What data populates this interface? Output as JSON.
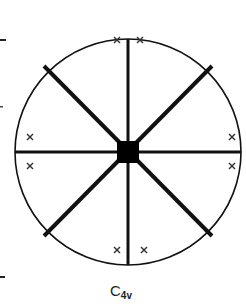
{
  "diagram": {
    "title_main": "C",
    "title_sub": "4v",
    "point_group": "C4v",
    "center": {
      "x": 128,
      "y": 152
    },
    "radius": 113,
    "colors": {
      "stroke": "#111111",
      "background": "#ffffff",
      "marks": "#333333"
    },
    "mirror_lines": [
      {
        "name": "vertical",
        "angle": 90
      },
      {
        "name": "horizontal",
        "angle": 0
      },
      {
        "name": "diagonal-1",
        "angle": 45
      },
      {
        "name": "diagonal-2",
        "angle": 135
      }
    ],
    "rotation_axis_symbol": "filled-square",
    "general_positions": [
      {
        "x": 117,
        "y": 40,
        "symbol": "×"
      },
      {
        "x": 140,
        "y": 40,
        "symbol": "×"
      },
      {
        "x": 30,
        "y": 137,
        "symbol": "×"
      },
      {
        "x": 30,
        "y": 166,
        "symbol": "×"
      },
      {
        "x": 232,
        "y": 137,
        "symbol": "×"
      },
      {
        "x": 232,
        "y": 166,
        "symbol": "×"
      },
      {
        "x": 117,
        "y": 250,
        "symbol": "×"
      },
      {
        "x": 144,
        "y": 250,
        "symbol": "×"
      }
    ],
    "edge_ticks": [
      {
        "x": 0,
        "y": 40
      },
      {
        "x": 0,
        "y": 107
      },
      {
        "x": 0,
        "y": 277
      }
    ]
  }
}
